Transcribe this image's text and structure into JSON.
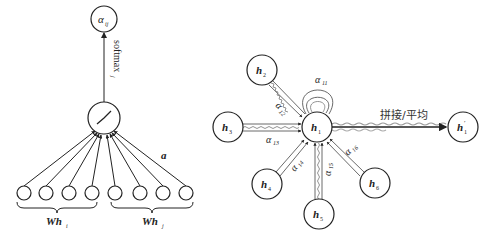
{
  "left_diagram": {
    "output_node": {
      "label": "α",
      "sub": "ij"
    },
    "activation_edge_label": {
      "text": "softmax",
      "sub": "j"
    },
    "activation_node": {
      "icon": "leaky-relu-icon"
    },
    "weight_vector_label": "a",
    "input_nodes_count": 8,
    "group_labels": [
      {
        "text": "Wh",
        "sub": "i"
      },
      {
        "text": "Wh",
        "sub": "j"
      }
    ]
  },
  "right_diagram": {
    "center_node": {
      "label": "h",
      "sub": "1"
    },
    "neighbors": [
      {
        "label": "h",
        "sub": "2",
        "edge_label": "α",
        "edge_sub": "12"
      },
      {
        "label": "h",
        "sub": "3",
        "edge_label": "α",
        "edge_sub": "13"
      },
      {
        "label": "h",
        "sub": "4",
        "edge_label": "α",
        "edge_sub": "14"
      },
      {
        "label": "h",
        "sub": "5",
        "edge_label": "α",
        "edge_sub": "15"
      },
      {
        "label": "h",
        "sub": "6",
        "edge_label": "α",
        "edge_sub": "16"
      }
    ],
    "self_loop": {
      "label": "α",
      "sub": "11"
    },
    "aggregate_label": "拼接/平均",
    "output_node": {
      "label": "h",
      "sub": "1",
      "prime": "′"
    }
  }
}
